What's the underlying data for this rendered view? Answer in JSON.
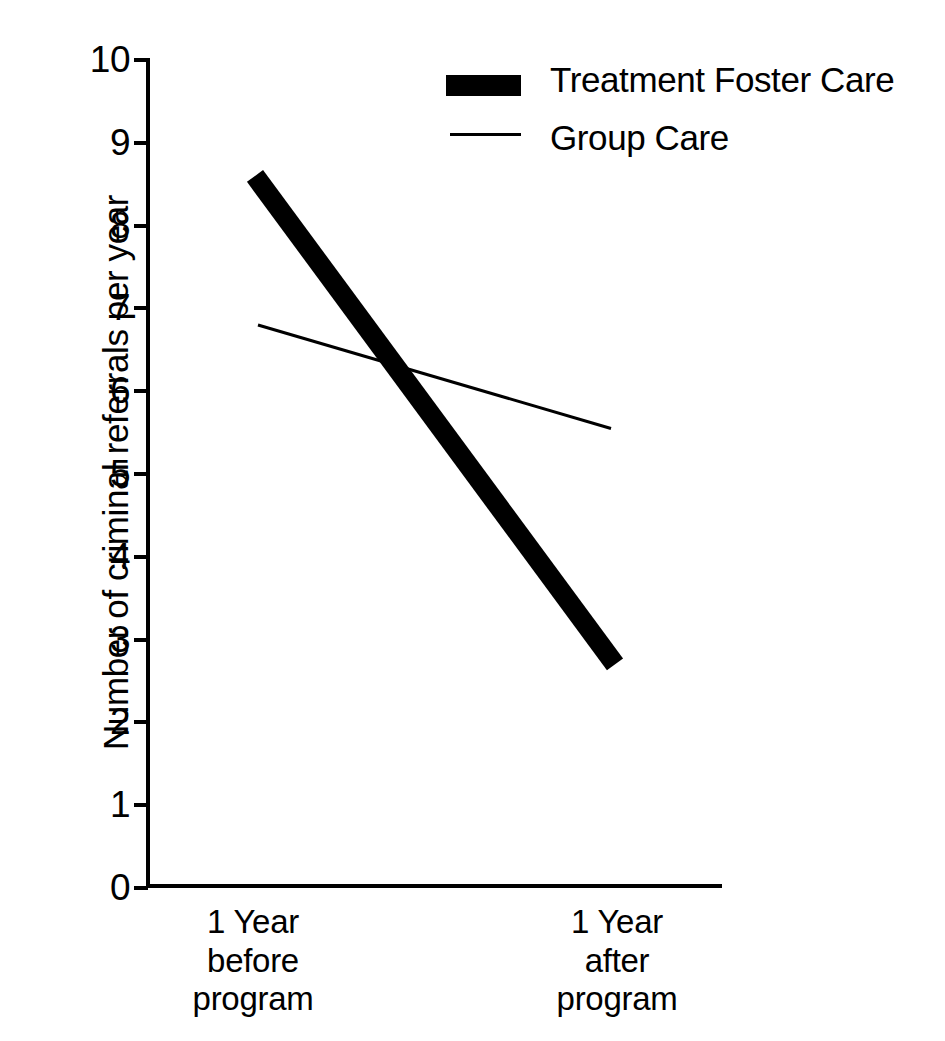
{
  "chart_data": {
    "type": "line",
    "title": "",
    "xlabel": "",
    "ylabel": "Number of criminal referrals per year",
    "categories": [
      "1 Year before program",
      "1 Year after program"
    ],
    "category_lines": [
      [
        "1 Year",
        "before",
        "program"
      ],
      [
        "1 Year",
        "after",
        "program"
      ]
    ],
    "ylim": [
      0,
      10
    ],
    "ytick_labels": [
      "0",
      "1",
      "2",
      "3",
      "4",
      "5",
      "6",
      "7",
      "8",
      "9",
      "10"
    ],
    "ytick_values": [
      0,
      1,
      2,
      3,
      4,
      5,
      6,
      7,
      8,
      9,
      10
    ],
    "grid": false,
    "legend_position": "top-right",
    "series": [
      {
        "name": "Treatment Foster Care",
        "values": [
          8.6,
          2.7
        ],
        "style": "thick-band",
        "color": "#000000",
        "line_width": 20
      },
      {
        "name": "Group Care",
        "values": [
          6.8,
          5.55
        ],
        "style": "thin-line",
        "color": "#000000",
        "line_width": 3
      }
    ],
    "annotations": []
  },
  "axis": {
    "y_label": "Number of criminal referrals per year",
    "y_ticks": [
      "10",
      "9",
      "8",
      "7",
      "6",
      "5",
      "4",
      "3",
      "2",
      "1",
      "0"
    ],
    "x_ticks": [
      {
        "line1": "1 Year",
        "line2": "before",
        "line3": "program"
      },
      {
        "line1": "1 Year",
        "line2": "after",
        "line3": "program"
      }
    ],
    "axis_color": "#000000"
  },
  "legend": {
    "items": [
      {
        "label": "Treatment Foster Care",
        "marker": "thick-bar-swatch",
        "color": "#000000"
      },
      {
        "label": "Group Care",
        "marker": "thin-line-swatch",
        "color": "#000000"
      }
    ]
  }
}
